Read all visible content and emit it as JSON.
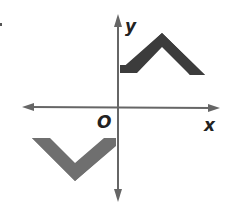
{
  "diagram": {
    "title": "",
    "axes": {
      "x_label": "x",
      "y_label": "y",
      "origin_label": "O",
      "axis_color": "#666666"
    },
    "shapes": [
      {
        "name": "upper-chevron",
        "color": "#3c3c3c",
        "description": "caret shape in quadrant I, starting on y-axis"
      },
      {
        "name": "lower-chevron",
        "color": "#6f6f6f",
        "description": "V shape in quadrant III, ending on y-axis"
      }
    ],
    "marker": "."
  }
}
